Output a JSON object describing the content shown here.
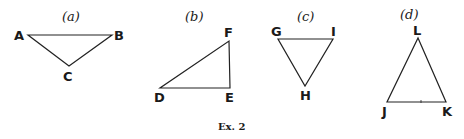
{
  "caption": "Ex. 2",
  "figures": [
    {
      "id": "a",
      "label": "(a)",
      "label_pos": [
        70,
        21
      ],
      "vertices": [
        {
          "name": "A",
          "x": 28,
          "y": 35,
          "lx": 17,
          "ly": 40
        },
        {
          "name": "B",
          "x": 112,
          "y": 35,
          "lx": 117,
          "ly": 40
        },
        {
          "name": "C",
          "x": 69,
          "y": 66,
          "lx": 63,
          "ly": 80
        }
      ]
    },
    {
      "id": "b",
      "label": "(b)",
      "label_pos": [
        193,
        21
      ],
      "vertices": [
        {
          "name": "D",
          "x": 160,
          "y": 88,
          "lx": 153,
          "ly": 101
        },
        {
          "name": "E",
          "x": 230,
          "y": 88,
          "lx": 224,
          "ly": 101
        },
        {
          "name": "F",
          "x": 229,
          "y": 41,
          "lx": 224,
          "ly": 36
        }
      ]
    },
    {
      "id": "c",
      "label": "(c)",
      "label_pos": [
        305,
        21
      ],
      "vertices": [
        {
          "name": "G",
          "x": 278,
          "y": 39,
          "lx": 271,
          "ly": 35
        },
        {
          "name": "I",
          "x": 333,
          "y": 39,
          "lx": 332,
          "ly": 35
        },
        {
          "name": "H",
          "x": 305,
          "y": 86,
          "lx": 300,
          "ly": 99
        }
      ]
    },
    {
      "id": "d",
      "label": "(d)",
      "label_pos": [
        408,
        19
      ],
      "vertices": [
        {
          "name": "J",
          "x": 387,
          "y": 102,
          "lx": 381,
          "ly": 115
        },
        {
          "name": "K",
          "x": 446,
          "y": 102,
          "lx": 441,
          "ly": 115
        },
        {
          "name": "L",
          "x": 418,
          "y": 38,
          "lx": 413,
          "ly": 34
        }
      ]
    }
  ]
}
